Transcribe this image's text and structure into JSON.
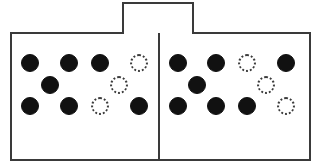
{
  "diagram": {
    "type": "schematic-line-drawing",
    "canvas": {
      "width": 325,
      "height": 168
    },
    "colors": {
      "background": "#ffffff",
      "stroke": "#3a3a3a",
      "filled_token": "#111111",
      "empty_token_stroke": "#3a3a3a"
    },
    "outer_frame": {
      "x": 10,
      "y": 32,
      "width": 301,
      "height": 129,
      "stroke_width": 2
    },
    "top_tab": {
      "x": 122,
      "y": 2,
      "width": 72,
      "height": 32,
      "stroke_width": 2,
      "label": ""
    },
    "center_divider": {
      "x": 158,
      "y": 33,
      "width": 2,
      "height": 128
    },
    "token_legend": {
      "filled": "occupied slot",
      "empty": "vacant slot"
    },
    "token_size": {
      "filled_diameter": 18,
      "empty_diameter": 18
    },
    "compartments": [
      {
        "name": "left-compartment",
        "rows": [
          {
            "row": "top",
            "y": 63,
            "tokens": [
              {
                "state": "filled",
                "x": 30
              },
              {
                "state": "filled",
                "x": 69
              },
              {
                "state": "filled",
                "x": 100
              },
              {
                "state": "empty",
                "x": 139
              }
            ]
          },
          {
            "row": "middle",
            "y": 85,
            "tokens": [
              {
                "state": "filled",
                "x": 50
              },
              {
                "state": "empty",
                "x": 119
              }
            ]
          },
          {
            "row": "bottom",
            "y": 106,
            "tokens": [
              {
                "state": "filled",
                "x": 30
              },
              {
                "state": "filled",
                "x": 69
              },
              {
                "state": "empty",
                "x": 100
              },
              {
                "state": "filled",
                "x": 139
              }
            ]
          }
        ],
        "counts": {
          "filled": 6,
          "empty": 4,
          "total": 10
        }
      },
      {
        "name": "right-compartment",
        "rows": [
          {
            "row": "top",
            "y": 63,
            "tokens": [
              {
                "state": "filled",
                "x": 178
              },
              {
                "state": "filled",
                "x": 216
              },
              {
                "state": "empty",
                "x": 247
              },
              {
                "state": "filled",
                "x": 286
              }
            ]
          },
          {
            "row": "middle",
            "y": 85,
            "tokens": [
              {
                "state": "filled",
                "x": 197
              },
              {
                "state": "empty",
                "x": 266
              }
            ]
          },
          {
            "row": "bottom",
            "y": 106,
            "tokens": [
              {
                "state": "filled",
                "x": 178
              },
              {
                "state": "filled",
                "x": 216
              },
              {
                "state": "filled",
                "x": 247
              },
              {
                "state": "empty",
                "x": 286
              }
            ]
          }
        ],
        "counts": {
          "filled": 7,
          "empty": 3,
          "total": 10
        }
      }
    ]
  }
}
